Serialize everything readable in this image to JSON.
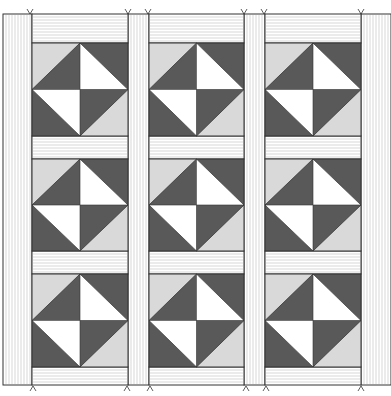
{
  "diagram": {
    "type": "quilt-layout",
    "block_name": "hourglass-diamond",
    "rows": 3,
    "columns": 3,
    "total_blocks": 9,
    "colors": {
      "background": "#ffffff",
      "dark": "#595959",
      "light": "#d9d9d9",
      "white": "#ffffff",
      "outline": "#333333",
      "sashing_stripe": "#bdbdbd"
    },
    "geometry": {
      "canvas": [
        391,
        396
      ],
      "top": 14,
      "bottom": 385,
      "left": 3,
      "right": 391,
      "vertical_sashing_columns": [
        [
          3,
          32
        ],
        [
          128,
          149
        ],
        [
          244,
          265
        ],
        [
          361,
          391
        ]
      ],
      "block_columns": [
        [
          32,
          128
        ],
        [
          149,
          244
        ],
        [
          265,
          361
        ]
      ],
      "horizontal_sashing_rows": [
        [
          14,
          43
        ],
        [
          136,
          159
        ],
        [
          251,
          274
        ],
        [
          367,
          385
        ]
      ],
      "block_rows": [
        [
          43,
          136
        ],
        [
          159,
          251
        ],
        [
          274,
          367
        ]
      ]
    },
    "block_pattern": {
      "corner_top_left": "light",
      "corner_top_right": "dark",
      "corner_bottom_left": "dark",
      "corner_bottom_right": "light",
      "diamond_top_left": "dark",
      "diamond_top_right": "white",
      "diamond_bottom_left": "white",
      "diamond_bottom_right": "dark"
    },
    "top_markers_x": [
      30,
      128,
      148,
      244,
      264,
      361
    ],
    "bottom_markers_x": [
      33,
      127,
      150,
      246,
      266,
      361
    ]
  }
}
